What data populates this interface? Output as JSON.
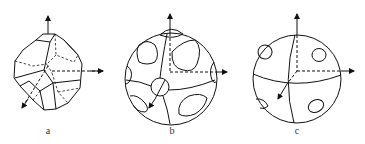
{
  "figure": {
    "panels": [
      {
        "id": "a",
        "label": "a",
        "description": "Truncated polyhedron (cuboctahedral-like crystal) with three coordinate axes, hidden edges dashed"
      },
      {
        "id": "b",
        "label": "b",
        "description": "Sphere with rounded-triangular facets, square-like facets and a small circular facet at axis intersection"
      },
      {
        "id": "c",
        "label": "c",
        "description": "Sphere with great-circle arcs and four small circular facets"
      }
    ],
    "colors": {
      "stroke": "#111111",
      "background": "#ffffff"
    }
  }
}
